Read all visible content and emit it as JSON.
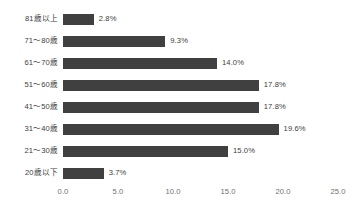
{
  "clipped_header_text": "",
  "colors": {
    "bar": "#404040",
    "background": "#ffffff",
    "category_label": "#3d3d3d",
    "value_label": "#3d3d3d",
    "tick_label": "#6f6f6f"
  },
  "chart_data": {
    "type": "bar",
    "orientation": "horizontal",
    "title": "",
    "subtitle": "",
    "xlabel": "",
    "ylabel": "",
    "xlim": [
      0.0,
      25.0
    ],
    "xticks": [
      0.0,
      5.0,
      10.0,
      15.0,
      20.0,
      25.0
    ],
    "xtick_labels": [
      "0.0",
      "5.0",
      "10.0",
      "15.0",
      "20.0",
      "25.0"
    ],
    "grid": false,
    "legend": false,
    "legend_position": "none",
    "value_label_suffix": "%",
    "categories": [
      "81歳以上",
      "71～80歳",
      "61～70歳",
      "51～60歳",
      "41～50歳",
      "31～40歳",
      "21～30歳",
      "20歳以下"
    ],
    "values": [
      2.8,
      9.3,
      14.0,
      17.8,
      17.8,
      19.6,
      15.0,
      3.7
    ],
    "value_labels": [
      "2.8%",
      "9.3%",
      "14.0%",
      "17.8%",
      "17.8%",
      "19.6%",
      "15.0%",
      "3.7%"
    ]
  }
}
